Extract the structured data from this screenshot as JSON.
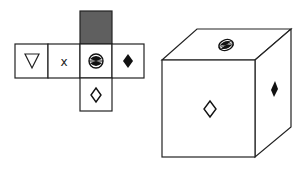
{
  "diagram": {
    "type": "cube-net-puzzle",
    "net": {
      "cells": [
        {
          "id": "top",
          "symbol": "shaded-square",
          "fill": "#5f5f5f",
          "x": 80,
          "y": 11,
          "w": 32,
          "h": 33
        },
        {
          "id": "left2",
          "symbol": "down-triangle-outline",
          "x": 15,
          "y": 44,
          "w": 33,
          "h": 34
        },
        {
          "id": "left1",
          "symbol": "x-letter",
          "label": "x",
          "x": 48,
          "y": 44,
          "w": 32,
          "h": 34
        },
        {
          "id": "center",
          "symbol": "hourglass-disc",
          "x": 80,
          "y": 44,
          "w": 32,
          "h": 34
        },
        {
          "id": "right",
          "symbol": "filled-diamond",
          "x": 112,
          "y": 44,
          "w": 32,
          "h": 34
        },
        {
          "id": "bottom",
          "symbol": "outline-diamond",
          "x": 80,
          "y": 78,
          "w": 32,
          "h": 33
        }
      ]
    },
    "cube": {
      "front_face_symbol": "outline-diamond",
      "top_face_symbol": "hourglass-disc",
      "right_face_symbol": "filled-diamond"
    },
    "colors": {
      "line": "#222222",
      "shaded": "#5f5f5f",
      "background": "#ffffff"
    }
  }
}
